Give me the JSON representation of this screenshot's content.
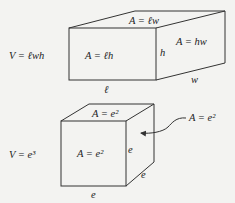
{
  "figure": {
    "box": {
      "volume_label": "V = ℓwh",
      "front_face_label": "A = ℓh",
      "top_face_label": "A = ℓw",
      "side_face_label": "A = hw",
      "length_label": "ℓ",
      "height_label": "h",
      "width_label": "w"
    },
    "cube": {
      "volume_label": "V = e³",
      "front_face_label": "A = e²",
      "top_face_label": "A = e²",
      "side_face_callout": "A = e²",
      "front_edge_label": "e",
      "side_edge_label": "e",
      "depth_edge_label": "e"
    }
  }
}
